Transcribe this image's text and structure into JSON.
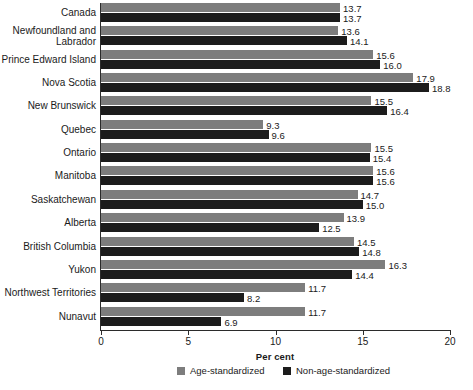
{
  "chart_data": {
    "type": "bar",
    "orientation": "horizontal",
    "title": "",
    "xlabel": "Per cent",
    "ylabel": "",
    "xlim": [
      0,
      20
    ],
    "xticks": [
      0,
      5,
      10,
      15,
      20
    ],
    "xtick_labels": [
      "0",
      "5",
      "10",
      "15",
      "20"
    ],
    "grid": false,
    "legend_position": "bottom",
    "categories": [
      "Canada",
      "Newfoundland and Labrador",
      "Prince Edward Island",
      "Nova Scotia",
      "New Brunswick",
      "Quebec",
      "Ontario",
      "Manitoba",
      "Saskatchewan",
      "Alberta",
      "British Columbia",
      "Yukon",
      "Northwest Territories",
      "Nunavut"
    ],
    "series": [
      {
        "name": "Age-standardized",
        "color": "#7d7d7d",
        "values": [
          13.7,
          13.6,
          15.6,
          17.9,
          15.5,
          9.3,
          15.5,
          15.6,
          14.7,
          13.9,
          14.5,
          16.3,
          11.7,
          11.7
        ]
      },
      {
        "name": "Non-age-standardized",
        "color": "#1c1c1c",
        "values": [
          13.7,
          14.1,
          16.0,
          18.8,
          16.4,
          9.6,
          15.4,
          15.6,
          15.0,
          12.5,
          14.8,
          14.4,
          8.2,
          6.9
        ]
      }
    ],
    "value_labels": [
      [
        "13.7",
        "13.7"
      ],
      [
        "13.6",
        "14.1"
      ],
      [
        "15.6",
        "16.0"
      ],
      [
        "17.9",
        "18.8"
      ],
      [
        "15.5",
        "16.4"
      ],
      [
        "9.3",
        "9.6"
      ],
      [
        "15.5",
        "15.4"
      ],
      [
        "15.6",
        "15.6"
      ],
      [
        "14.7",
        "15.0"
      ],
      [
        "13.9",
        "12.5"
      ],
      [
        "14.5",
        "14.8"
      ],
      [
        "16.3",
        "14.4"
      ],
      [
        "11.7",
        "8.2"
      ],
      [
        "11.7",
        "6.9"
      ]
    ]
  },
  "legend": {
    "items": [
      {
        "label": "Age-standardized",
        "swatch": "gray"
      },
      {
        "label": "Non-age-standardized",
        "swatch": "dark"
      }
    ]
  }
}
